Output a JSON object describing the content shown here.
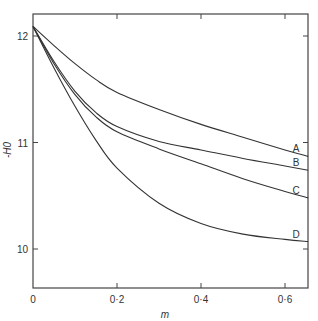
{
  "chart_data": {
    "type": "line",
    "title": "",
    "xlabel": "m",
    "ylabel": "-H0",
    "xlim": [
      0,
      0.655
    ],
    "ylim": [
      9.62,
      12.65
    ],
    "xticks": [
      "0",
      "0·2",
      "0·4",
      "0·6"
    ],
    "yticks": [
      "10",
      "11",
      "12"
    ],
    "grid": false,
    "legend": "curve end labels",
    "x": [
      0,
      0.05,
      0.1,
      0.15,
      0.2,
      0.3,
      0.4,
      0.5,
      0.6,
      0.655
    ],
    "series": [
      {
        "name": "A",
        "values": [
          12.09,
          11.91,
          11.74,
          11.59,
          11.47,
          11.31,
          11.17,
          11.05,
          10.93,
          10.87
        ]
      },
      {
        "name": "B",
        "values": [
          12.09,
          11.76,
          11.48,
          11.28,
          11.15,
          11.01,
          10.93,
          10.85,
          10.78,
          10.74
        ]
      },
      {
        "name": "C",
        "values": [
          12.09,
          11.74,
          11.45,
          11.24,
          11.1,
          10.94,
          10.8,
          10.66,
          10.54,
          10.48
        ]
      },
      {
        "name": "D",
        "values": [
          12.09,
          11.7,
          11.34,
          11.02,
          10.76,
          10.43,
          10.24,
          10.14,
          10.09,
          10.07
        ]
      }
    ]
  }
}
